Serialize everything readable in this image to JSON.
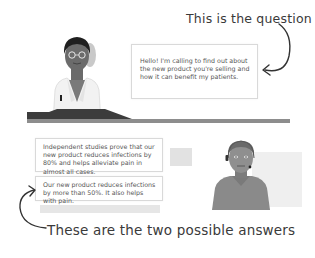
{
  "annotations": {
    "question_label": "This is the question",
    "answers_label": "These are the two possible answers"
  },
  "question": {
    "speaker": "doctor",
    "text": "Hello! I'm calling to find out about the new product you're selling and how it can benefit my patients."
  },
  "answers": [
    {
      "text": "Independent studies prove that our new product reduces infections by 80% and helps alleviate pain in almost all cases."
    },
    {
      "text": "Our new product reduces infections by more than 50%. It also helps with pain."
    }
  ],
  "characters": {
    "doctor": {
      "role": "doctor",
      "icon": "doctor-avatar-icon"
    },
    "sales_rep": {
      "role": "sales representative with headset",
      "icon": "sales-rep-avatar-icon"
    }
  },
  "colors": {
    "desk": "#3c3c3c",
    "floor": "#8d8d8d",
    "bubble_border": "#d9d9d9",
    "annotation_ink": "#3a3a3a"
  }
}
